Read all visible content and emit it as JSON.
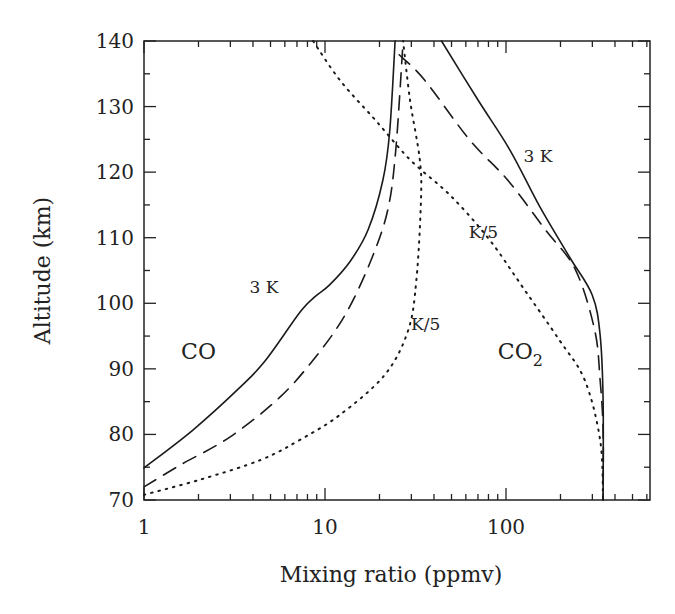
{
  "chart_data": {
    "type": "line",
    "title": "",
    "xlabel": "Mixing ratio (ppmv)",
    "ylabel": "Altitude (km)",
    "xscale": "log",
    "xlim": [
      1,
      650
    ],
    "ylim": [
      70,
      140
    ],
    "grid": false,
    "legend": "none",
    "x_tick_labels": [
      "1",
      "10",
      "100"
    ],
    "x_ticks": [
      1,
      10,
      100
    ],
    "y_tick_labels": [
      "70",
      "80",
      "90",
      "100",
      "110",
      "120",
      "130",
      "140"
    ],
    "y_ticks": [
      70,
      80,
      90,
      100,
      110,
      120,
      130,
      140
    ],
    "series": [
      {
        "name": "CO 3 K",
        "species": "CO",
        "style": "solid",
        "x": [
          1,
          1.87,
          3.4,
          4.7,
          7.3,
          8.8,
          10.6,
          13.7,
          17.3,
          20.9,
          22.8,
          24.4
        ],
        "y": [
          74.9,
          80.7,
          87.2,
          91.3,
          98.7,
          101,
          102.8,
          106.3,
          111.2,
          118.8,
          126.4,
          140
        ]
      },
      {
        "name": "CO K",
        "species": "CO",
        "style": "dashed",
        "x": [
          1,
          1.58,
          2.98,
          5.6,
          8.8,
          12.9,
          17.8,
          22.2,
          24.6,
          27
        ],
        "y": [
          72,
          75.3,
          79.6,
          85.6,
          91.7,
          98.2,
          106.3,
          114.2,
          123.4,
          140
        ]
      },
      {
        "name": "CO K/5",
        "species": "CO",
        "style": "dotted",
        "x": [
          1,
          2.04,
          4.4,
          7.3,
          12.1,
          21.4,
          28.8,
          32,
          33.9,
          33.4,
          29.5,
          27
        ],
        "y": [
          70.8,
          73.1,
          76.1,
          79.2,
          83,
          89.1,
          95.9,
          103.6,
          115.8,
          121.9,
          131,
          140
        ]
      },
      {
        "name": "CO2 3 K",
        "species": "CO2",
        "style": "solid",
        "x": [
          44,
          70,
          105,
          154,
          226,
          299,
          331,
          344,
          344
        ],
        "y": [
          140,
          131,
          123.4,
          114.7,
          106.9,
          101.3,
          95.2,
          85.3,
          70
        ]
      },
      {
        "name": "CO2 K",
        "species": "CO2",
        "style": "dashed",
        "x": [
          25.7,
          35.6,
          63,
          102,
          165,
          242,
          309,
          331,
          344,
          344
        ],
        "y": [
          137.9,
          134,
          124.9,
          118.8,
          111.2,
          105.1,
          95.9,
          88.3,
          80.7,
          70
        ]
      },
      {
        "name": "CO2 K/5",
        "species": "CO2",
        "style": "dotted",
        "x": [
          8.6,
          12.1,
          18.9,
          29.5,
          49,
          81,
          127,
          197,
          272,
          331,
          344
        ],
        "y": [
          140,
          134,
          128,
          121.9,
          116.5,
          109.7,
          102,
          94.4,
          88.3,
          79.2,
          70
        ]
      }
    ],
    "annotations": [
      {
        "text": "3 K",
        "x": 4.6,
        "y": 101.5
      },
      {
        "text": "CO",
        "x": 2.0,
        "y": 91.5
      },
      {
        "text": "K/5",
        "x": 36,
        "y": 96
      },
      {
        "text": "3 K",
        "x": 150,
        "y": 121.5
      },
      {
        "text": "K/5",
        "x": 75,
        "y": 110
      },
      {
        "text": "CO",
        "sub": "2",
        "x": 120,
        "y": 91.5
      }
    ]
  }
}
